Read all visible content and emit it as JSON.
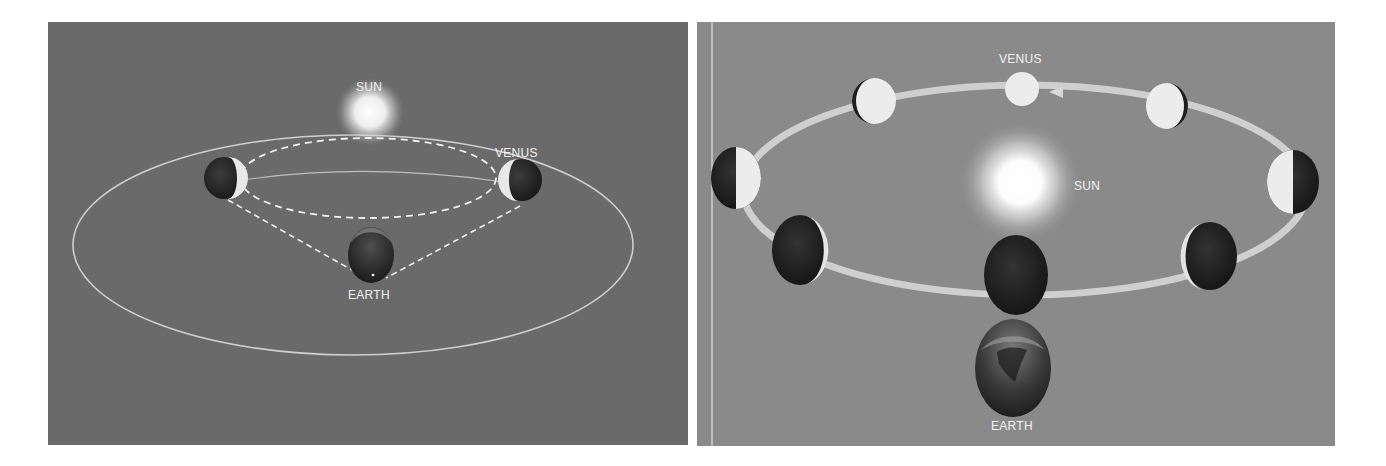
{
  "figure": {
    "panels": [
      {
        "id": "left",
        "description": "Geometry of Venus's orbit relative to Earth, showing the lines of sight from Earth to Venus at its extreme positions",
        "labels": {
          "sun": "SUN",
          "venus": "VENUS",
          "earth": "EARTH"
        },
        "elements": [
          "sun",
          "venus-orbit (dashed)",
          "earth-orbit (solid)",
          "venus-left-crescent",
          "venus-right-crescent",
          "earth",
          "sightlines (dashed)"
        ]
      },
      {
        "id": "right",
        "description": "Phases of Venus as it orbits the Sun, viewed from Earth",
        "labels": {
          "sun": "SUN",
          "venus": "VENUS",
          "earth": "EARTH"
        },
        "orbit_direction": "counterclockwise (arrow pointing left at top)",
        "venus_phases": [
          "full",
          "gibbous-waning",
          "half-lit-right",
          "crescent",
          "new",
          "crescent",
          "half-lit-left",
          "gibbous-waxing"
        ]
      }
    ],
    "colors": {
      "left_background": "#6a6a6a",
      "right_background": "#8a8a8a",
      "orbit_line": "#d8d8d8",
      "planet_dark": "#262626",
      "planet_lit": "#eeeeee",
      "label_text": "#f2f2f2"
    }
  }
}
